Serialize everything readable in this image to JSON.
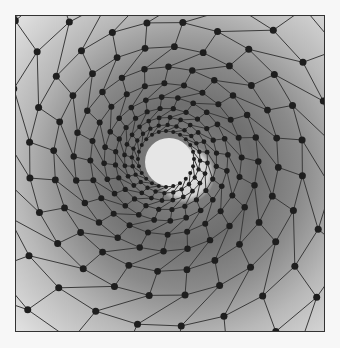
{
  "figure": {
    "node_color": "#1e1e1e",
    "line_color": "#3a3a3a",
    "center_disk_color": "#e6e6e6",
    "rings": 13,
    "spokes": 24,
    "twist": 0.9
  }
}
